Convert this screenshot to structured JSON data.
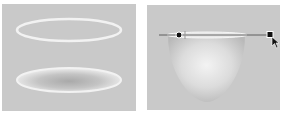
{
  "panels": [
    {
      "id": "left",
      "description": "ellipse-outline-and-shaded-ellipse",
      "items": [
        "glowing-ellipse-ring",
        "shaded-ellipse"
      ]
    },
    {
      "id": "right",
      "description": "shaded-dome-with-gradient-handle",
      "items": [
        "dome-shape",
        "gradient-line",
        "gradient-handle-start",
        "gradient-handle-end",
        "pointer-cursor"
      ]
    }
  ],
  "colors": {
    "panel_bg": "#c9c9c9",
    "highlight": "#f4f4f4",
    "handle": "#111111"
  }
}
